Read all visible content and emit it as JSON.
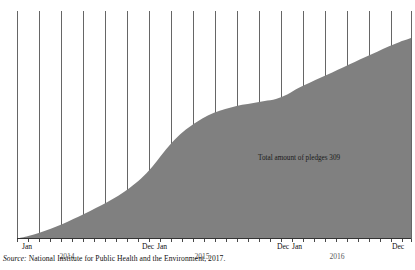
{
  "figure": {
    "source_prefix": "Source:",
    "source_text": " National Institute for Public Health and the Environment, 2017.",
    "annotation": "Total amount of pledges 309"
  },
  "colors": {
    "area_fill": "#808080",
    "gridline": "#555555",
    "axis": "#333333",
    "text": "#111111",
    "year_text": "#5a5a5a",
    "background": "#ffffff"
  },
  "axis": {
    "month_labels": [
      {
        "text": "Jan",
        "x": 22
      },
      {
        "text": "Dec",
        "x": 142
      },
      {
        "text": "Jan",
        "x": 157
      },
      {
        "text": "Dec",
        "x": 277
      },
      {
        "text": "Jan",
        "x": 292
      },
      {
        "text": "Dec",
        "x": 392
      }
    ],
    "year_labels": [
      {
        "text": "2014",
        "x": 67
      },
      {
        "text": "2015",
        "x": 202
      },
      {
        "text": "2016",
        "x": 337
      }
    ],
    "tick_positions": [
      17,
      28,
      39,
      50,
      61,
      72,
      83,
      94,
      105,
      116,
      127,
      138,
      149,
      160,
      171,
      182,
      193,
      204,
      215,
      226,
      237,
      248,
      259,
      270,
      281,
      292,
      303,
      314,
      325,
      336,
      347,
      358,
      369,
      380,
      391,
      402,
      411
    ],
    "gridline_positions": [
      17,
      39,
      61,
      83,
      105,
      127,
      149,
      171,
      193,
      215,
      237,
      259,
      281,
      303,
      325,
      347,
      369,
      391,
      411
    ]
  },
  "chart_data": {
    "type": "area",
    "title": "",
    "subtitle": "",
    "xlabel": "",
    "ylabel": "",
    "grid": true,
    "legend_position": "none",
    "annotations": [
      {
        "text": "Total amount of pledges 309",
        "x": "2015-08",
        "y": 140
      }
    ],
    "axis_ranges": {
      "x": [
        "2014-01",
        "2016-12"
      ],
      "y": [
        0,
        309
      ]
    },
    "categories": [
      "2014-01",
      "2014-02",
      "2014-03",
      "2014-04",
      "2014-05",
      "2014-06",
      "2014-07",
      "2014-08",
      "2014-09",
      "2014-10",
      "2014-11",
      "2014-12",
      "2015-01",
      "2015-02",
      "2015-03",
      "2015-04",
      "2015-05",
      "2015-06",
      "2015-07",
      "2015-08",
      "2015-09",
      "2015-10",
      "2015-11",
      "2015-12",
      "2016-01",
      "2016-02",
      "2016-03",
      "2016-04",
      "2016-05",
      "2016-06",
      "2016-07",
      "2016-08",
      "2016-09",
      "2016-10",
      "2016-11",
      "2016-12"
    ],
    "series": [
      {
        "name": "Cumulative pledges",
        "values": [
          0,
          4,
          9,
          15,
          22,
          30,
          38,
          47,
          56,
          66,
          78,
          92,
          110,
          132,
          152,
          168,
          180,
          190,
          197,
          202,
          206,
          209,
          212,
          215,
          222,
          232,
          240,
          248,
          256,
          264,
          272,
          280,
          288,
          296,
          303,
          309
        ]
      }
    ],
    "total_label": "Total amount of pledges 309",
    "total_value": 309
  }
}
